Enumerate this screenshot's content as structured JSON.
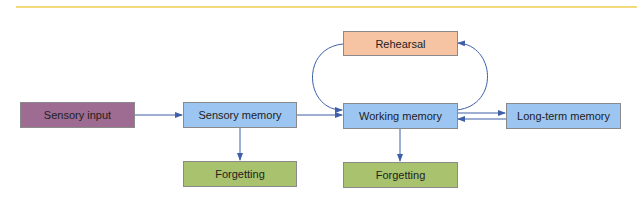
{
  "diagram": {
    "nodes": [
      {
        "id": "sensory_input",
        "label": "Sensory input",
        "color": "#9e6b93"
      },
      {
        "id": "sensory_memory",
        "label": "Sensory memory",
        "color": "#9cc5f2"
      },
      {
        "id": "working_memory",
        "label": "Working memory",
        "color": "#9cc5f2"
      },
      {
        "id": "long_term_memory",
        "label": "Long-term memory",
        "color": "#9cc5f2"
      },
      {
        "id": "rehearsal",
        "label": "Rehearsal",
        "color": "#f7c4a3"
      },
      {
        "id": "forgetting_1",
        "label": "Forgetting",
        "color": "#a9c26e"
      },
      {
        "id": "forgetting_2",
        "label": "Forgetting",
        "color": "#a9c26e"
      }
    ],
    "edges": [
      {
        "from": "sensory_input",
        "to": "sensory_memory"
      },
      {
        "from": "sensory_memory",
        "to": "working_memory"
      },
      {
        "from": "sensory_memory",
        "to": "forgetting_1"
      },
      {
        "from": "working_memory",
        "to": "forgetting_2"
      },
      {
        "from": "working_memory",
        "to": "long_term_memory"
      },
      {
        "from": "long_term_memory",
        "to": "working_memory"
      },
      {
        "from": "working_memory",
        "to": "rehearsal"
      },
      {
        "from": "rehearsal",
        "to": "working_memory"
      }
    ],
    "line_color": "#3f5fa8"
  }
}
